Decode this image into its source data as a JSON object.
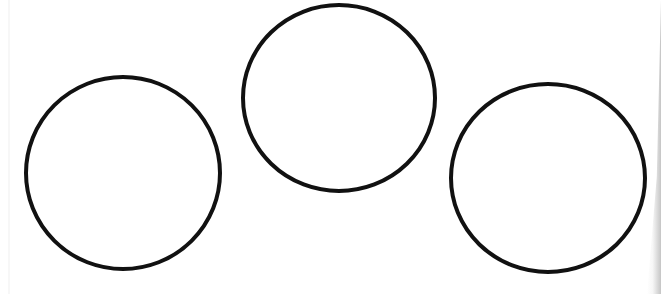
{
  "scene": {
    "description": "Three hand-drawn circles on white paper",
    "background_color": "#ffffff",
    "stroke_color": "#111111",
    "stroke_width": 4
  },
  "circles": [
    {
      "name": "left-circle",
      "cx": 123,
      "cy": 173,
      "rx": 97,
      "ry": 96
    },
    {
      "name": "middle-circle",
      "cx": 339,
      "cy": 98,
      "rx": 96,
      "ry": 93
    },
    {
      "name": "right-circle",
      "cx": 548,
      "cy": 178,
      "rx": 97,
      "ry": 94
    }
  ]
}
